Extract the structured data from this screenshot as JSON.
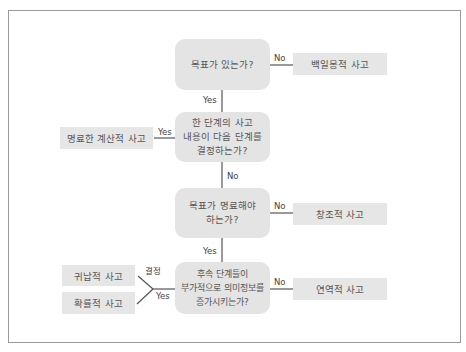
{
  "decisions": [
    {
      "id": "d1",
      "text": "목표가 있는가?"
    },
    {
      "id": "d2",
      "text": "한 단계의 사고\n내용이 다음 단계를\n결정하는가?"
    },
    {
      "id": "d3",
      "text": "목표가 명료해야\n하는가?"
    },
    {
      "id": "d4",
      "text": "후속 단계들이\n부가적으로 의미정보를\n증가시키는가?"
    }
  ],
  "results": [
    {
      "id": "r1",
      "text": "백일몽적 사고"
    },
    {
      "id": "r2",
      "text": "명료한 계산적 사고"
    },
    {
      "id": "r3",
      "text": "창조적 사고"
    },
    {
      "id": "r4",
      "text": "연역적 사고"
    },
    {
      "id": "r5",
      "text": "귀납적 사고"
    },
    {
      "id": "r6",
      "text": "확률적 사고"
    }
  ],
  "edge_labels": {
    "d1_no": "No",
    "d1_yes": "Yes",
    "d2_yes": "Yes",
    "d2_no": "No",
    "d3_no": "No",
    "d3_yes": "Yes",
    "d4_no": "No",
    "d4_yes": "Yes",
    "d4_decision": "결정"
  },
  "colors": {
    "box_fill": "#e4e4e4",
    "text": "#555555",
    "line": "#555555",
    "frame": "#9a9a9a"
  }
}
